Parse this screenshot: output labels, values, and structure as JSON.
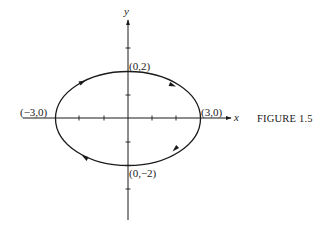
{
  "figure": {
    "caption": "FIGURE 1.5",
    "axes": {
      "x_label": "x",
      "y_label": "y",
      "x_ticks": [
        -4,
        -3,
        -2,
        -1,
        1,
        2,
        3,
        4
      ],
      "y_ticks": [
        -4,
        -3,
        -2,
        -1,
        1,
        2,
        3
      ]
    },
    "curve": {
      "type": "ellipse",
      "equation": "x^2/9 + y^2/4 = 1",
      "semi_axis_x": 3,
      "semi_axis_y": 2,
      "orientation": "clockwise",
      "direction_arrows": 4
    },
    "points": [
      {
        "label": "(0,2)",
        "x": 0,
        "y": 2
      },
      {
        "label": "(3,0)",
        "x": 3,
        "y": 0
      },
      {
        "label": "(0,−2)",
        "x": 0,
        "y": -2
      },
      {
        "label": "(−3,0)",
        "x": -3,
        "y": 0
      }
    ]
  },
  "colors": {
    "ink": "#1a1a1a",
    "background": "#ffffff"
  }
}
